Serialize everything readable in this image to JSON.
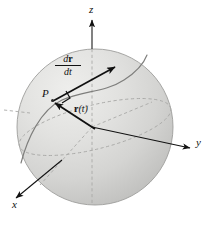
{
  "figure": {
    "type": "diagram",
    "background_color": "#ffffff",
    "sphere": {
      "fill_light": "#e3e3e1",
      "fill_dark": "#c9c9c7",
      "outline_color": "#9a9a98",
      "center_x": 95,
      "center_y": 127,
      "radius": 78
    },
    "axes": [
      {
        "name": "z-axis",
        "label": "z",
        "label_x": 92,
        "label_y": 6,
        "direction": "up",
        "style": "dashed-inside-solid-outside"
      },
      {
        "name": "y-axis",
        "label": "y",
        "label_x": 197,
        "label_y": 143,
        "direction": "lower-right",
        "style": "solid-with-arrow"
      },
      {
        "name": "x-axis",
        "label": "x",
        "label_x": 14,
        "label_y": 205,
        "direction": "lower-left",
        "style": "solid-with-arrow"
      }
    ],
    "annotations": [
      {
        "name": "point-p",
        "label": "P",
        "x": 47,
        "y": 97,
        "kind": "point-on-curve"
      },
      {
        "name": "position-vector",
        "label_prefix": "r",
        "label_suffix": "(t)",
        "label_x": 68,
        "label_y": 110,
        "kind": "vector",
        "from": "origin",
        "to": "P"
      },
      {
        "name": "derivative-vector",
        "numerator_prefix": "d",
        "numerator_bold": "r",
        "denominator": "dt",
        "label_x": 62,
        "label_y": 57,
        "kind": "fraction-label",
        "describes": "tangent velocity vector at P"
      }
    ],
    "curve": {
      "name": "trajectory-curve",
      "color": "#7d7d7b",
      "description": "S-shaped path across the sphere through point P"
    },
    "right_angle_marker": {
      "name": "right-angle-marker",
      "present": true,
      "at": "P"
    },
    "colors": {
      "ink": "#111111",
      "dashed": "#a8a8a6",
      "curve": "#7d7d7b",
      "sphere_light": "#e6e6e4",
      "sphere_mid": "#d6d6d4",
      "sphere_dark": "#c2c2c0"
    }
  }
}
